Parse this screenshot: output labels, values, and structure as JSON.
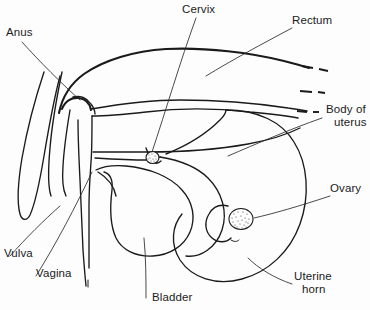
{
  "figure": {
    "background_color": "#fdfdfd",
    "ink_color": "#1a1a1a",
    "width": 370,
    "height": 310
  },
  "labels": {
    "anus": "Anus",
    "cervix": "Cervix",
    "rectum": "Rectum",
    "body_of_uterus_line1": "Body of",
    "body_of_uterus_line2": "uterus",
    "ovary": "Ovary",
    "vulva": "Vulva",
    "vagina": "Vagina",
    "bladder": "Bladder",
    "uterine_horn_line1": "Uterine",
    "uterine_horn_line2": "horn"
  },
  "structures": [
    {
      "name": "anus",
      "label": "Anus",
      "kind": "opening"
    },
    {
      "name": "cervix",
      "label": "Cervix",
      "kind": "stippled-organ"
    },
    {
      "name": "rectum",
      "label": "Rectum",
      "kind": "tube"
    },
    {
      "name": "body-of-uterus",
      "label": "Body of uterus",
      "kind": "tube"
    },
    {
      "name": "ovary",
      "label": "Ovary",
      "kind": "stippled-organ"
    },
    {
      "name": "vulva",
      "label": "Vulva",
      "kind": "opening"
    },
    {
      "name": "vagina",
      "label": "Vagina",
      "kind": "tube"
    },
    {
      "name": "bladder",
      "label": "Bladder",
      "kind": "sac"
    },
    {
      "name": "uterine-horn",
      "label": "Uterine horn",
      "kind": "coil"
    }
  ],
  "annotations": {
    "cut_edge_marks": 3,
    "cut_edge_note": "dashed line ends at right margin indicate structures continue beyond view"
  }
}
